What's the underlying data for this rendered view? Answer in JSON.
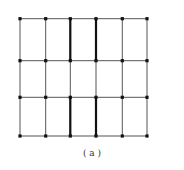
{
  "figure": {
    "caption": "( a )",
    "grid": {
      "columns_x": [
        20,
        45.7,
        70.3,
        96,
        122.3,
        147
      ],
      "rows_y": [
        18.7,
        60.7,
        97.3,
        136
      ],
      "line_color": "#555555",
      "bold_color": "#111111",
      "node_color": "#111111"
    },
    "bold_segments": [
      {
        "col": 2,
        "from_row": 0,
        "to_row": 1
      },
      {
        "col": 3,
        "from_row": 0,
        "to_row": 1
      },
      {
        "col": 2,
        "from_row": 2,
        "to_row": 3
      },
      {
        "col": 3,
        "from_row": 2,
        "to_row": 3
      }
    ]
  }
}
